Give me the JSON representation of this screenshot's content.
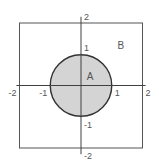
{
  "diagram": {
    "type": "set-region-diagram",
    "colors": {
      "background": "#ffffff",
      "axis": "#404040",
      "square_stroke": "#555555",
      "circle_fill": "#d4d4d4",
      "circle_stroke": "#333333",
      "text": "#555555"
    },
    "square": {
      "xmin": -2,
      "xmax": 2,
      "ymin": -2,
      "ymax": 2,
      "label": "B"
    },
    "circle": {
      "cx": 0,
      "cy": 0,
      "r": 1,
      "label": "A"
    },
    "axes": {
      "x_range": [
        -2.1,
        2.1
      ],
      "y_range": [
        -2.2,
        2.2
      ],
      "x_ticks": [
        {
          "value": -2,
          "label": "-2"
        },
        {
          "value": -1,
          "label": "-1"
        },
        {
          "value": 1,
          "label": "1"
        },
        {
          "value": 2,
          "label": "2"
        }
      ],
      "y_ticks": [
        {
          "value": 2,
          "label": "2"
        },
        {
          "value": 1,
          "label": "1"
        },
        {
          "value": -1,
          "label": "-1"
        },
        {
          "value": -2,
          "label": "-2"
        }
      ]
    },
    "region_labels": [
      {
        "name": "A",
        "x": 0.25,
        "y": 0.3
      },
      {
        "name": "B",
        "x": 1.25,
        "y": 1.3
      }
    ]
  }
}
